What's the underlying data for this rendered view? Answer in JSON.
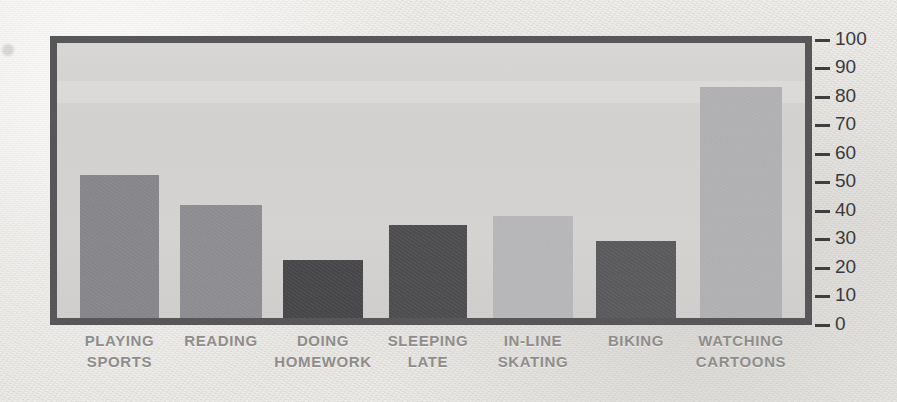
{
  "chart_data": {
    "type": "bar",
    "title": "",
    "subtitle": "",
    "xlabel": "",
    "ylabel": "",
    "ylim": [
      0,
      100
    ],
    "yticks": [
      0,
      10,
      20,
      30,
      40,
      50,
      60,
      70,
      80,
      90,
      100
    ],
    "ytick_labels": [
      "0",
      "10",
      "20",
      "30",
      "40",
      "50",
      "60",
      "70",
      "80",
      "90",
      "100"
    ],
    "grid": false,
    "legend": false,
    "legend_position": "none",
    "tick_side": "right",
    "categories": [
      "PLAYING SPORTS",
      "READING",
      "DOING HOMEWORK",
      "SLEEPING LATE",
      "IN-LINE SKATING",
      "BIKING",
      "WATCHING CARTOONS"
    ],
    "category_lines": [
      [
        "PLAYING",
        "SPORTS"
      ],
      [
        "READING",
        ""
      ],
      [
        "DOING",
        "HOMEWORK"
      ],
      [
        "SLEEPING",
        "LATE"
      ],
      [
        "IN-LINE",
        "SKATING"
      ],
      [
        "BIKING",
        ""
      ],
      [
        "WATCHING",
        "CARTOONS"
      ]
    ],
    "values": [
      52,
      41,
      21,
      34,
      37,
      28,
      84
    ],
    "bar_colors": [
      "#85858a",
      "#8d8d91",
      "#47474a",
      "#4d4d50",
      "#b6b6b8",
      "#5a5a5d",
      "#b0b0b2"
    ]
  },
  "style": {
    "page_background": "#eceae7",
    "plot_background": "#d3d2d0",
    "frame_color": "#57575a",
    "tick_color": "#3f3f42",
    "tick_label_color": "#3a3a3d",
    "category_label_color": "#8e8d8b"
  }
}
